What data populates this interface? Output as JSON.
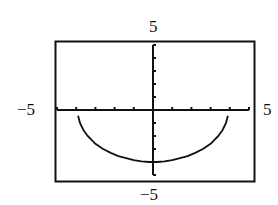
{
  "chart_data": {
    "type": "line",
    "title": "",
    "xlabel": "",
    "ylabel": "",
    "xlim": [
      -5,
      5
    ],
    "ylim": [
      -5,
      5
    ],
    "x_tick_step": 1,
    "y_tick_step": 1,
    "grid": false,
    "legend": null,
    "window_labels": {
      "xmin": "−5",
      "xmax": "5",
      "ymin": "−5",
      "ymax": "5"
    },
    "series": [
      {
        "name": "y = -sqrt(16 - x^2)",
        "x": [
          -3.9,
          -3.8,
          -3.6,
          -3.4,
          -3.2,
          -3.0,
          -2.6,
          -2.2,
          -1.8,
          -1.4,
          -1.0,
          -0.6,
          -0.2,
          0.0,
          0.2,
          0.6,
          1.0,
          1.4,
          1.8,
          2.2,
          2.6,
          3.0,
          3.2,
          3.4,
          3.6,
          3.8,
          3.9
        ],
        "values": [
          -0.45,
          -1.0,
          -1.6,
          -2.0,
          -2.3,
          -2.6,
          -3.0,
          -3.3,
          -3.55,
          -3.7,
          -3.85,
          -3.95,
          -4.0,
          -4.0,
          -4.0,
          -3.95,
          -3.85,
          -3.7,
          -3.55,
          -3.3,
          -3.0,
          -2.6,
          -2.3,
          -2.0,
          -1.6,
          -1.0,
          -0.45
        ]
      }
    ],
    "color": "#111111"
  }
}
